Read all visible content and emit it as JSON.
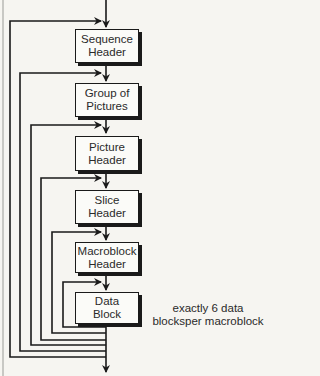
{
  "diagram": {
    "boxes": [
      {
        "id": "sequence-header",
        "line1": "Sequence",
        "line2": "Header"
      },
      {
        "id": "group-of-pictures",
        "line1": "Group of",
        "line2": "Pictures"
      },
      {
        "id": "picture-header",
        "line1": "Picture",
        "line2": "Header"
      },
      {
        "id": "slice-header",
        "line1": "Slice",
        "line2": "Header"
      },
      {
        "id": "macroblock-header",
        "line1": "Macroblock",
        "line2": "Header"
      },
      {
        "id": "data-block",
        "line1": "Data",
        "line2": "Block"
      }
    ],
    "annotation": {
      "line1": "exactly 6 data",
      "line2": "blocksper macroblock"
    },
    "colors": {
      "line": "#1a1a1a",
      "background": "#f6f5f1",
      "box_fill": "#fbfbf8"
    }
  }
}
